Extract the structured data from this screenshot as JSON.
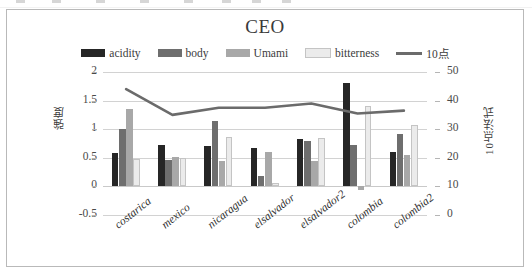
{
  "window": {
    "top_strip_present": true
  },
  "chart_data": {
    "type": "bar",
    "title": "CEO",
    "xlabel": "",
    "ylabel": "強度",
    "y2label": "10点法式",
    "categories": [
      "costarica",
      "mexico",
      "nicaragua",
      "elsalvador",
      "elsalvador2",
      "colombia",
      "colombia2"
    ],
    "ylim": [
      -0.5,
      2
    ],
    "yticks": [
      2,
      1.5,
      1,
      0.5,
      0,
      -0.5
    ],
    "y2lim": [
      0,
      50
    ],
    "y2ticks": [
      50,
      40,
      30,
      20,
      10,
      0
    ],
    "grid": true,
    "legend_position": "top",
    "series": [
      {
        "name": "acidity",
        "type": "bar",
        "axis": "left",
        "color": "#262626",
        "values": [
          0.59,
          0.73,
          0.71,
          0.67,
          0.83,
          1.8,
          0.61
        ]
      },
      {
        "name": "body",
        "type": "bar",
        "axis": "left",
        "color": "#6e6e6e",
        "values": [
          1.01,
          0.47,
          1.14,
          0.18,
          0.79,
          0.73,
          0.92
        ]
      },
      {
        "name": "Umami",
        "type": "bar",
        "axis": "left",
        "color": "#a8a8a8",
        "values": [
          1.36,
          0.51,
          0.45,
          0.61,
          0.45,
          -0.06,
          0.55
        ]
      },
      {
        "name": "bitterness",
        "type": "bar",
        "axis": "left",
        "color": "#ebebeb",
        "values": [
          0.48,
          0.49,
          0.87,
          0.06,
          0.84,
          1.4,
          1.08
        ]
      },
      {
        "name": "10点",
        "type": "line",
        "axis": "right",
        "color": "#6b6b6b",
        "values": [
          44.0,
          35.0,
          37.5,
          37.5,
          39.0,
          35.5,
          36.5
        ]
      }
    ]
  },
  "legend": {
    "items": [
      {
        "label": "acidity",
        "marker": "swatch",
        "color": "#262626"
      },
      {
        "label": "body",
        "marker": "swatch",
        "color": "#6e6e6e"
      },
      {
        "label": "Umami",
        "marker": "swatch",
        "color": "#a8a8a8"
      },
      {
        "label": "bitterness",
        "marker": "swatch",
        "color": "#ebebeb"
      },
      {
        "label": "10点",
        "marker": "line",
        "color": "#6b6b6b"
      }
    ]
  }
}
